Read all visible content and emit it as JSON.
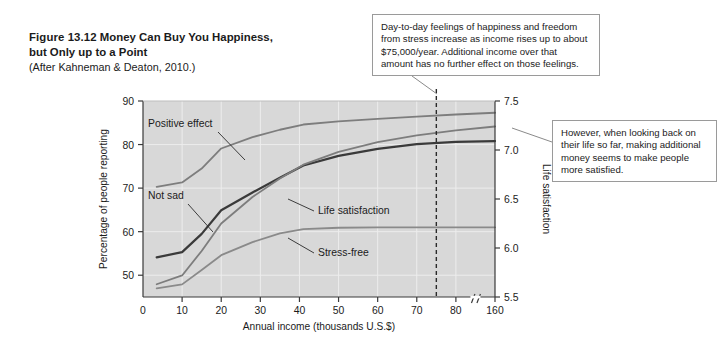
{
  "figure": {
    "number": "Figure 13.12",
    "title": "Money Can Buy You Happiness, but Only up to a Point",
    "source": "(After Kahneman & Deaton, 2010.)"
  },
  "callouts": {
    "top": "Day-to-day feelings of happiness and freedom from stress increase as income rises up to about $75,000/year. Additional income over that amount has no further effect on those feelings.",
    "right": "However, when looking back on their life so far, making additional money seems to make people more satisfied."
  },
  "chart_data": {
    "type": "line",
    "title": "Money Can Buy You Happiness, but Only up to a Point",
    "xlabel": "Annual income (thousands U.S.$)",
    "ylabel": "Percentage of people reporting",
    "y2label": "Life satisfaction",
    "xlim": [
      0,
      90
    ],
    "ylim": [
      45,
      90
    ],
    "y2lim": [
      5.5,
      7.5
    ],
    "xticks": [
      0,
      10,
      20,
      30,
      40,
      50,
      60,
      70,
      80,
      160
    ],
    "xticklabels": [
      "0",
      "10",
      "20",
      "30",
      "40",
      "50",
      "60",
      "70",
      "80",
      "160"
    ],
    "yticks": [
      50,
      60,
      70,
      80,
      90
    ],
    "yticklabels": [
      "50",
      "60",
      "70",
      "80",
      "90"
    ],
    "y2ticks": [
      5.5,
      6.0,
      6.5,
      7.0,
      7.5
    ],
    "y2ticklabels": [
      "5.5",
      "6.0",
      "6.5",
      "7.0",
      "7.5"
    ],
    "grid": true,
    "axis_break_after": 80,
    "annotation_line_x": 75,
    "annotation_line_label": "$75,000/year",
    "plot_bg": "#d8d8d8",
    "legend": "inline-labels",
    "series": [
      {
        "name": "Positive effect",
        "axis": "left",
        "color": "#7d7d7d",
        "x": [
          3.5,
          10,
          15,
          20,
          28,
          35,
          41,
          50,
          60,
          70,
          80,
          90
        ],
        "values": [
          70.3,
          71.3,
          74.5,
          79.1,
          81.7,
          83.4,
          84.6,
          85.3,
          85.9,
          86.4,
          86.9,
          87.3
        ]
      },
      {
        "name": "Not sad",
        "axis": "left",
        "color": "#3a3a3a",
        "x": [
          3.5,
          10,
          15,
          20,
          28,
          35,
          41,
          50,
          60,
          70,
          80,
          90
        ],
        "values": [
          54.1,
          55.3,
          59.5,
          64.9,
          69.0,
          72.4,
          75.2,
          77.4,
          79.0,
          80.1,
          80.6,
          80.8
        ]
      },
      {
        "name": "Life satisfaction",
        "axis": "right",
        "color": "#7d7d7d",
        "x": [
          3.5,
          10,
          15,
          20,
          28,
          35,
          41,
          50,
          60,
          70,
          80,
          90
        ],
        "values": [
          5.63,
          5.72,
          5.97,
          6.25,
          6.52,
          6.71,
          6.85,
          6.98,
          7.08,
          7.15,
          7.2,
          7.24
        ]
      },
      {
        "name": "Stress-free",
        "axis": "left",
        "color": "#8a8a8a",
        "x": [
          3.5,
          10,
          15,
          20,
          28,
          35,
          41,
          50,
          60,
          70,
          80,
          90
        ],
        "values": [
          47.0,
          47.9,
          51.2,
          54.6,
          57.6,
          59.6,
          60.6,
          60.9,
          61.0,
          61.0,
          61.0,
          61.0
        ]
      }
    ],
    "series_label_positions": [
      {
        "name": "Positive effect",
        "label": "Positive effect",
        "lx": 148,
        "ly": 127
      },
      {
        "name": "Not sad",
        "label": "Not sad",
        "lx": 148,
        "ly": 199
      },
      {
        "name": "Life satisfaction",
        "label": "Life satisfaction",
        "lx": 318,
        "ly": 214
      },
      {
        "name": "Stress-free",
        "label": "Stress-free",
        "lx": 318,
        "ly": 256
      }
    ]
  }
}
